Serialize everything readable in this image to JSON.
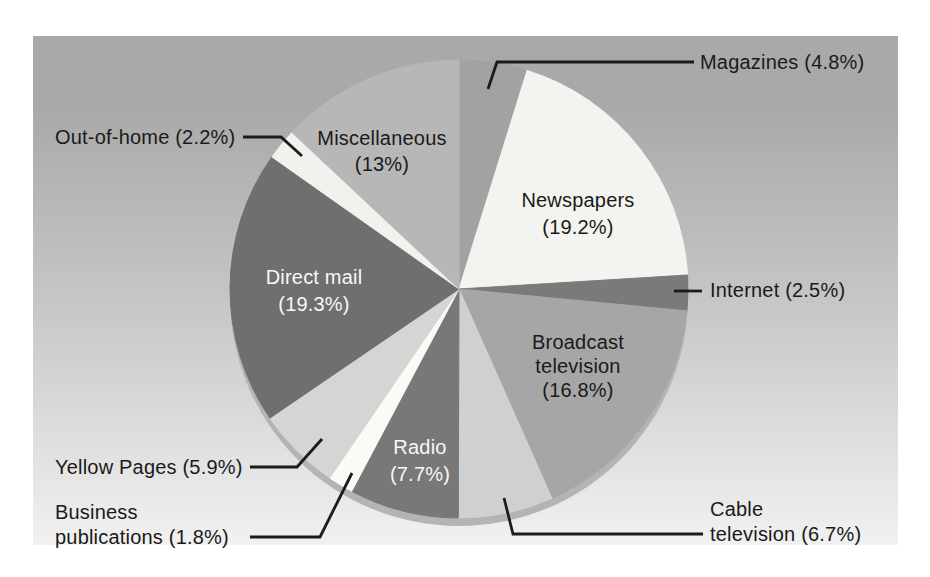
{
  "panel": {
    "gradient_top_color": "#a9a9a9",
    "gradient_mid_color": "#c6c6c6",
    "gradient_bottom_color": "#f1f1f1"
  },
  "chart_data": {
    "type": "pie",
    "title": "",
    "legend_position": "none",
    "units": "percent",
    "direction": "clockwise",
    "start_angle_deg": 0,
    "center": {
      "x": 459,
      "y": 289
    },
    "radius": 229,
    "depth_offset": 8,
    "depth_color": "#b4b4b4",
    "leader_color": "#1b1b1b",
    "leader_width": 2.8,
    "slices": [
      {
        "name": "Magazines",
        "pct": 4.8,
        "color": "#a2a2a2",
        "label": {
          "lines": [
            "Magazines (4.8%)"
          ],
          "x": 700,
          "y": 62,
          "lh": 26,
          "align": "left",
          "color": "#1a1a1a"
        },
        "leader": [
          [
            694,
            62
          ],
          [
            497,
            62
          ],
          [
            488,
            89
          ]
        ]
      },
      {
        "name": "Newspapers",
        "pct": 19.2,
        "color": "#f3f3ef",
        "label": {
          "lines": [
            "Newspapers",
            "(19.2%)"
          ],
          "x": 578,
          "y": 200,
          "lh": 27,
          "align": "center",
          "color": "#1a1a1a"
        }
      },
      {
        "name": "Internet",
        "pct": 2.5,
        "color": "#7a7a7a",
        "label": {
          "lines": [
            "Internet (2.5%)"
          ],
          "x": 710,
          "y": 290,
          "lh": 26,
          "align": "left",
          "color": "#1a1a1a"
        },
        "leader": [
          [
            702,
            291
          ],
          [
            674,
            291
          ]
        ]
      },
      {
        "name": "Broadcast television",
        "pct": 16.8,
        "color": "#a6a6a6",
        "label": {
          "lines": [
            "Broadcast",
            "television",
            "(16.8%)"
          ],
          "x": 578,
          "y": 342,
          "lh": 24,
          "align": "center",
          "color": "#1a1a1a"
        }
      },
      {
        "name": "Cable television",
        "pct": 6.7,
        "color": "#d0d0d0",
        "label": {
          "lines": [
            "Cable",
            "television (6.7%)"
          ],
          "x": 710,
          "y": 509,
          "lh": 25,
          "align": "left",
          "color": "#1a1a1a"
        },
        "leader": [
          [
            703,
            534
          ],
          [
            513,
            534
          ],
          [
            504,
            498
          ]
        ]
      },
      {
        "name": "Radio",
        "pct": 7.7,
        "color": "#787878",
        "label": {
          "lines": [
            "Radio",
            "(7.7%)"
          ],
          "x": 420,
          "y": 447,
          "lh": 27,
          "align": "center",
          "color": "#f7f7f7"
        }
      },
      {
        "name": "Business publications",
        "pct": 1.8,
        "color": "#fafaf7",
        "label": {
          "lines": [
            "Business",
            "publications (1.8%)"
          ],
          "x": 55,
          "y": 512,
          "lh": 25,
          "align": "left",
          "color": "#1a1a1a"
        },
        "leader": [
          [
            250,
            537
          ],
          [
            320,
            537
          ],
          [
            352,
            473
          ]
        ]
      },
      {
        "name": "Yellow Pages",
        "pct": 5.9,
        "color": "#d5d5d3",
        "label": {
          "lines": [
            "Yellow Pages (5.9%)"
          ],
          "x": 55,
          "y": 467,
          "lh": 26,
          "align": "left",
          "color": "#1a1a1a"
        },
        "leader": [
          [
            250,
            467
          ],
          [
            297,
            467
          ],
          [
            322,
            439
          ]
        ]
      },
      {
        "name": "Direct mail",
        "pct": 19.3,
        "color": "#6f6f6f",
        "label": {
          "lines": [
            "Direct mail",
            "(19.3%)"
          ],
          "x": 314,
          "y": 277,
          "lh": 27,
          "align": "center",
          "color": "#f7f7f7"
        }
      },
      {
        "name": "Out-of-home",
        "pct": 2.2,
        "color": "#f1f1ee",
        "label": {
          "lines": [
            "Out-of-home (2.2%)"
          ],
          "x": 55,
          "y": 137,
          "lh": 26,
          "align": "left",
          "color": "#1a1a1a"
        },
        "leader": [
          [
            243,
            137
          ],
          [
            281,
            137
          ],
          [
            302,
            156
          ]
        ]
      },
      {
        "name": "Miscellaneous",
        "pct": 13,
        "color": "#b7b7b7",
        "label": {
          "lines": [
            "Miscellaneous",
            "(13%)"
          ],
          "x": 382,
          "y": 138,
          "lh": 26,
          "align": "center",
          "color": "#1a1a1a"
        }
      }
    ]
  }
}
